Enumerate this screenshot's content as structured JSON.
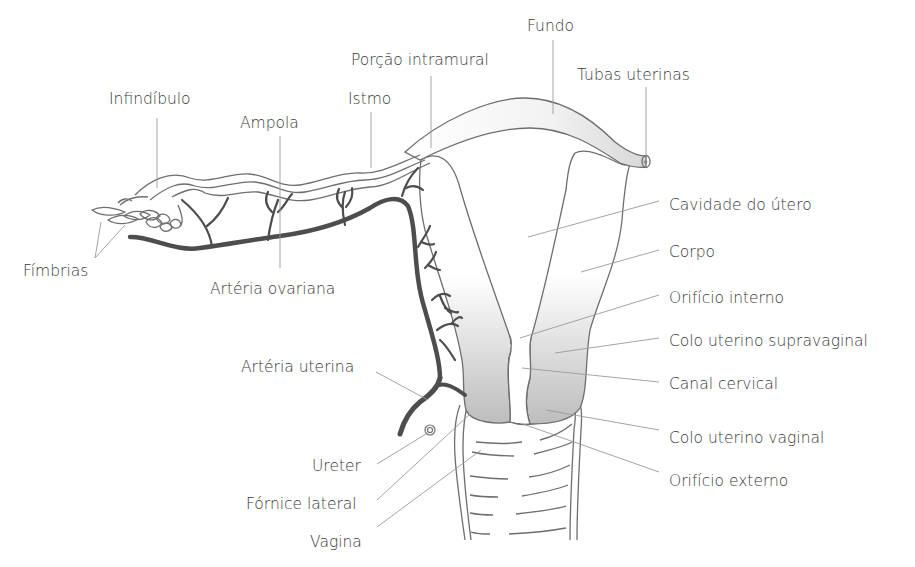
{
  "diagram": {
    "labels": {
      "fundo": "Fundo",
      "porcao_intramural": "Porção intramural",
      "tubas_uterinas": "Tubas uterinas",
      "infundibulo": "Infindíbulo",
      "istmo": "Istmo",
      "ampola": "Ampola",
      "fimbrias": "Fímbrias",
      "arteria_ovariana": "Artéria ovariana",
      "cavidade_do_utero": "Cavidade do útero",
      "corpo": "Corpo",
      "orificio_interno": "Orifício interno",
      "colo_uterino_supravaginal": "Colo uterino supravaginal",
      "canal_cervical": "Canal cervical",
      "colo_uterino_vaginal": "Colo uterino vaginal",
      "orificio_externo": "Orifício externo",
      "arteria_uterina": "Artéria uterina",
      "ureter": "Ureter",
      "fornice_lateral": "Fórnice lateral",
      "vagina": "Vagina"
    },
    "colors": {
      "text": "#3a3a3a",
      "leader_line": "#9a9a9a",
      "outline": "#6e6e6e",
      "artery": "#4d4d4d",
      "shade_light": "#ffffff",
      "shade_dark": "#c4c4c4"
    }
  }
}
